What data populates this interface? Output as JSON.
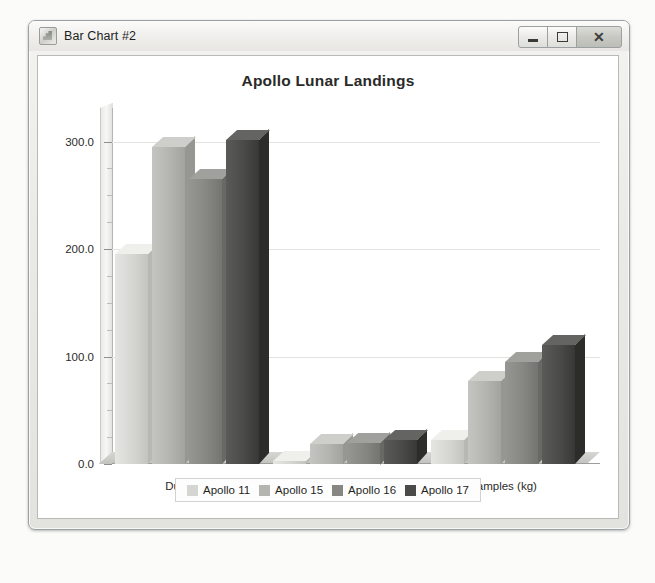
{
  "window": {
    "title": "Bar Chart #2",
    "icon": "java-app-icon",
    "buttons": {
      "minimize": "minimize-button",
      "maximize": "maximize-button",
      "close": "close-button",
      "close_glyph": "✕"
    }
  },
  "chart_data": {
    "type": "bar",
    "title": "Apollo Lunar Landings",
    "xlabel": "",
    "ylabel": "",
    "ylim": [
      0,
      320
    ],
    "yticks": [
      "0.0",
      "100.0",
      "200.0",
      "300.0"
    ],
    "ytick_values": [
      0,
      100,
      200,
      300
    ],
    "minor_tick_step": 25,
    "grid": true,
    "legend_position": "bottom",
    "effect": "3d",
    "categories": [
      "Duration",
      "EVA Time",
      "Samples (kg)"
    ],
    "series": [
      {
        "name": "Apollo 11",
        "color": "#d5d5d2",
        "values": [
          195,
          2.5,
          22
        ]
      },
      {
        "name": "Apollo 15",
        "color": "#b4b4b0",
        "values": [
          295,
          19,
          77
        ]
      },
      {
        "name": "Apollo 16",
        "color": "#868683",
        "values": [
          265,
          20,
          95
        ]
      },
      {
        "name": "Apollo 17",
        "color": "#4a4a48",
        "values": [
          301,
          22,
          111
        ]
      }
    ]
  }
}
